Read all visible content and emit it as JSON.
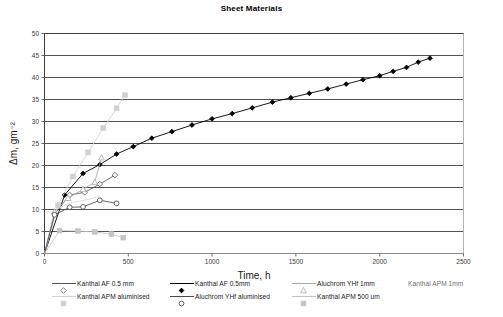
{
  "chart": {
    "title": "Sheet Materials",
    "xlabel": "Time, h",
    "ylabel_html": "Δm, gm⁻²",
    "ylabel": "Δm, gm-2"
  },
  "legend": {
    "items": [
      {
        "label": "Kanthal AF 0.5 mm",
        "color": "#555555",
        "marker": "open-diamond",
        "row": 1,
        "col": 1
      },
      {
        "label": "Kanthal AF 0.5mm",
        "color": "#000000",
        "marker": "filled-diamond",
        "row": 1,
        "col": 2
      },
      {
        "label": "Aluchrom YHf 1mm",
        "color": "#a8a8a8",
        "marker": "open-triangle",
        "row": 1,
        "col": 3
      },
      {
        "label": "Kanthal APM 1mm",
        "color": "#d8d8d8",
        "marker": "none",
        "row": 1,
        "col": 4
      },
      {
        "label": "Kanthal APM aluminised",
        "color": "#d0d0d0",
        "marker": "filled-square",
        "row": 2,
        "col": 1
      },
      {
        "label": "Aluchrom YHf aluminised",
        "color": "#4a4a4a",
        "marker": "open-circle",
        "row": 2,
        "col": 2
      },
      {
        "label": "Kanthal APM 500 um",
        "color": "#c4c4c4",
        "marker": "filled-square",
        "row": 2,
        "col": 3
      }
    ]
  },
  "chart_data": {
    "type": "line",
    "title": "Sheet Materials",
    "xlabel": "Time, h",
    "ylabel": "Δm, gm⁻²",
    "xlim": [
      0,
      2500
    ],
    "ylim": [
      0,
      50
    ],
    "xticks": [
      0,
      500,
      1000,
      1500,
      2000,
      2500
    ],
    "yticks": [
      0,
      5,
      10,
      15,
      20,
      25,
      30,
      35,
      40,
      45,
      50
    ],
    "grid": "horizontal",
    "legend_position": "below",
    "series": [
      {
        "name": "Kanthal AF 0.5 mm",
        "color": "#555555",
        "marker": "open-diamond",
        "points": [
          [
            0,
            0
          ],
          [
            60,
            9.0
          ],
          [
            150,
            13.3
          ],
          [
            240,
            13.9
          ],
          [
            330,
            15.8
          ],
          [
            420,
            17.8
          ]
        ]
      },
      {
        "name": "Kanthal AF 0.5mm",
        "color": "#000000",
        "marker": "filled-diamond",
        "points": [
          [
            0,
            0
          ],
          [
            120,
            13.3
          ],
          [
            230,
            18.2
          ],
          [
            330,
            20.2
          ],
          [
            430,
            22.6
          ],
          [
            530,
            24.3
          ],
          [
            640,
            26.2
          ],
          [
            760,
            27.7
          ],
          [
            880,
            29.2
          ],
          [
            1000,
            30.6
          ],
          [
            1120,
            31.8
          ],
          [
            1240,
            33.1
          ],
          [
            1360,
            34.4
          ],
          [
            1470,
            35.4
          ],
          [
            1580,
            36.4
          ],
          [
            1690,
            37.4
          ],
          [
            1800,
            38.5
          ],
          [
            1900,
            39.5
          ],
          [
            2000,
            40.4
          ],
          [
            2080,
            41.4
          ],
          [
            2160,
            42.3
          ],
          [
            2230,
            43.5
          ],
          [
            2300,
            44.4
          ]
        ]
      },
      {
        "name": "Aluchrom YHf 1mm",
        "color": "#a8a8a8",
        "marker": "open-triangle",
        "points": [
          [
            0,
            0
          ],
          [
            60,
            9.5
          ],
          [
            140,
            12.6
          ],
          [
            230,
            14.6
          ],
          [
            300,
            16.2
          ],
          [
            340,
            21.8
          ]
        ]
      },
      {
        "name": "Kanthal APM 1mm",
        "color": "#d8d8d8",
        "marker": "none",
        "points": [
          [
            0,
            0
          ],
          [
            70,
            10.0
          ],
          [
            150,
            11.5
          ],
          [
            240,
            12.1
          ],
          [
            330,
            13.0
          ]
        ]
      },
      {
        "name": "Kanthal APM aluminised",
        "color": "#d0d0d0",
        "marker": "filled-square",
        "points": [
          [
            0,
            0
          ],
          [
            80,
            11.0
          ],
          [
            170,
            17.5
          ],
          [
            260,
            23.0
          ],
          [
            350,
            28.5
          ],
          [
            430,
            33.0
          ],
          [
            480,
            36.0
          ]
        ]
      },
      {
        "name": "Aluchrom YHf aluminised",
        "color": "#4a4a4a",
        "marker": "open-circle",
        "points": [
          [
            0,
            0
          ],
          [
            60,
            8.8
          ],
          [
            150,
            10.5
          ],
          [
            230,
            10.6
          ],
          [
            330,
            12.1
          ],
          [
            430,
            11.4
          ]
        ]
      },
      {
        "name": "Kanthal APM 500 um",
        "color": "#c4c4c4",
        "marker": "filled-square",
        "points": [
          [
            0,
            0
          ],
          [
            90,
            5.2
          ],
          [
            200,
            5.1
          ],
          [
            300,
            4.9
          ],
          [
            400,
            4.4
          ],
          [
            470,
            3.6
          ]
        ]
      }
    ]
  }
}
